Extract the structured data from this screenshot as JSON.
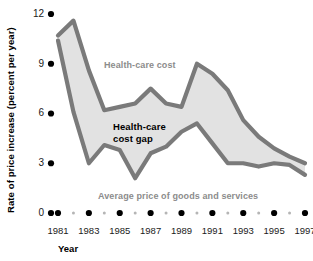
{
  "chart_data": {
    "type": "area",
    "title": "",
    "xlabel": "Year",
    "ylabel": "Rate of price increase (percent per year)",
    "ylim": [
      0,
      12.6
    ],
    "xlim": [
      1980.6,
      1997.4
    ],
    "yticks": [
      0,
      3,
      6,
      9,
      12
    ],
    "ytick_labels": [
      "0",
      "3",
      "6",
      "9",
      "12"
    ],
    "xticks": [
      1981,
      1983,
      1985,
      1987,
      1989,
      1991,
      1993,
      1995,
      1997
    ],
    "xtick_labels": [
      "1981",
      "1983",
      "1985",
      "1987",
      "1989",
      "1991",
      "1993",
      "1995",
      "1997"
    ],
    "x_minor_ticks": [
      1982,
      1984,
      1986,
      1988,
      1990,
      1992,
      1994,
      1996
    ],
    "grid": false,
    "legend_position": "inline-annotations",
    "x": [
      1981,
      1982,
      1983,
      1984,
      1985,
      1986,
      1987,
      1988,
      1989,
      1990,
      1991,
      1992,
      1993,
      1994,
      1995,
      1996,
      1997
    ],
    "series": [
      {
        "name": "Health-care cost",
        "color": "#7a7a7a",
        "values": [
          10.7,
          11.6,
          8.6,
          6.2,
          6.4,
          6.6,
          7.5,
          6.6,
          6.4,
          9.0,
          8.4,
          7.4,
          5.6,
          4.6,
          3.9,
          3.4,
          3.0
        ]
      },
      {
        "name": "Average price of goods and services",
        "color": "#7a7a7a",
        "values": [
          10.4,
          6.1,
          3.0,
          4.1,
          3.8,
          2.1,
          3.6,
          4.0,
          4.9,
          5.4,
          4.2,
          3.0,
          3.0,
          2.8,
          3.0,
          2.9,
          2.3
        ]
      }
    ],
    "band_fill_color": "#e2e2e2",
    "band_label": "Health-care cost gap",
    "annotations": [
      {
        "id": "upper-series-label",
        "text": "Health-care cost",
        "color": "#8c8c8c"
      },
      {
        "id": "band-label",
        "text": "Health-care cost gap",
        "color": "#000000"
      },
      {
        "id": "lower-series-label",
        "text": "Average price of goods and services",
        "color": "#8c8c8c"
      }
    ]
  },
  "axes": {
    "y_title": "Rate of price increase (percent per year)",
    "x_title": "Year"
  },
  "annotations": {
    "upper_label": "Health-care cost",
    "gap_label_line1": "Health-care",
    "gap_label_line2": "cost gap",
    "lower_label": "Average price of goods and services"
  },
  "colors": {
    "line": "#7a7a7a",
    "fill": "#e2e2e2",
    "tick_dot": "#000000",
    "minor_dot": "#b5b5b5",
    "text": "#1a1a1a",
    "gray_text": "#8c8c8c"
  }
}
